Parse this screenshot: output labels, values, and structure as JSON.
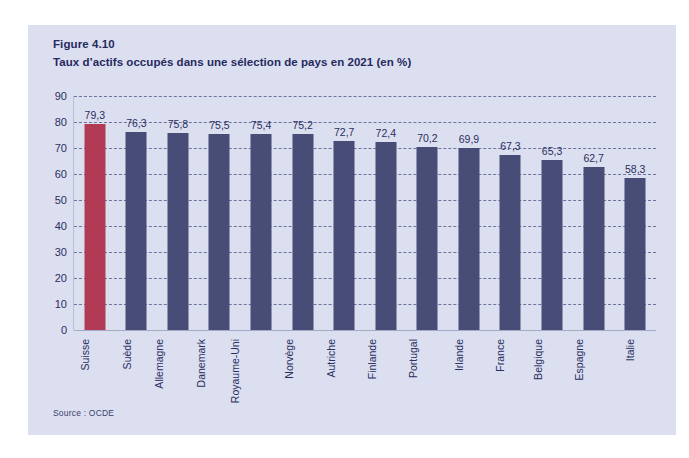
{
  "figure": {
    "number": "Figure 4.10",
    "title": "Taux d’actifs occupés dans une sélection de pays en 2021 (en %)",
    "source": "Source : OCDE"
  },
  "colors": {
    "panel_background": "#dcdff0",
    "bar_default": "#474d77",
    "bar_highlight": "#b13b55",
    "text": "#2a2e60",
    "gridline": "#5b6090"
  },
  "chart_data": {
    "type": "bar",
    "title": "Taux d’actifs occupés dans une sélection de pays en 2021 (en %)",
    "xlabel": "",
    "ylabel": "",
    "ylim": [
      0,
      90
    ],
    "yticks": [
      0,
      10,
      20,
      30,
      40,
      50,
      60,
      70,
      80,
      90
    ],
    "ytick_labels": [
      "0",
      "10",
      "20",
      "30",
      "40",
      "50",
      "60",
      "70",
      "80",
      "90"
    ],
    "grid": true,
    "legend": null,
    "highlight_category": "Suisse",
    "categories": [
      "Suisse",
      "Suède",
      "Allemagne",
      "Danemark",
      "Royaume-Uni",
      "Norvège",
      "Autriche",
      "Finlande",
      "Portugal",
      "Irlande",
      "France",
      "Belgique",
      "Espagne",
      "Italie"
    ],
    "values": [
      79.3,
      76.3,
      75.8,
      75.5,
      75.4,
      75.2,
      72.7,
      72.4,
      70.2,
      69.9,
      67.3,
      65.3,
      62.7,
      58.3
    ],
    "value_labels": [
      "79,3",
      "76,3",
      "75,8",
      "75,5",
      "75,4",
      "75,2",
      "72,7",
      "72,4",
      "70,2",
      "69,9",
      "67,3",
      "65,3",
      "62,7",
      "58,3"
    ]
  }
}
